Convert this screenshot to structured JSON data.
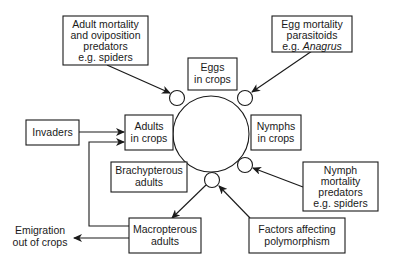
{
  "diagram": {
    "central_node": {
      "name": "life-cycle-circle"
    },
    "boxes": {
      "adult_mortality": {
        "lines": [
          "Adult mortality",
          "and oviposition",
          "predators",
          "e.g. spiders"
        ]
      },
      "egg_mortality": {
        "lines": [
          "Egg mortality",
          "parasitoids",
          "e.g. "
        ],
        "italic_suffix": "Anagrus"
      },
      "eggs": {
        "lines": [
          "Eggs",
          "in crops"
        ]
      },
      "invaders": {
        "lines": [
          "Invaders"
        ]
      },
      "adults": {
        "lines": [
          "Adults",
          "in crops"
        ]
      },
      "nymphs": {
        "lines": [
          "Nymphs",
          "in crops"
        ]
      },
      "brachypterous": {
        "lines": [
          "Brachypterous",
          "adults"
        ]
      },
      "nymph_mortality": {
        "lines": [
          "Nymph",
          "mortality",
          "predators",
          "e.g. spiders"
        ]
      },
      "macropterous": {
        "lines": [
          "Macropterous",
          "adults"
        ]
      },
      "polymorphism": {
        "lines": [
          "Factors affecting",
          "polymorphism"
        ]
      }
    },
    "free_text": {
      "emigration": {
        "lines": [
          "Emigration",
          "out of crops"
        ]
      }
    },
    "colors": {
      "stroke": "#1a1a1a",
      "background": "#ffffff"
    }
  }
}
